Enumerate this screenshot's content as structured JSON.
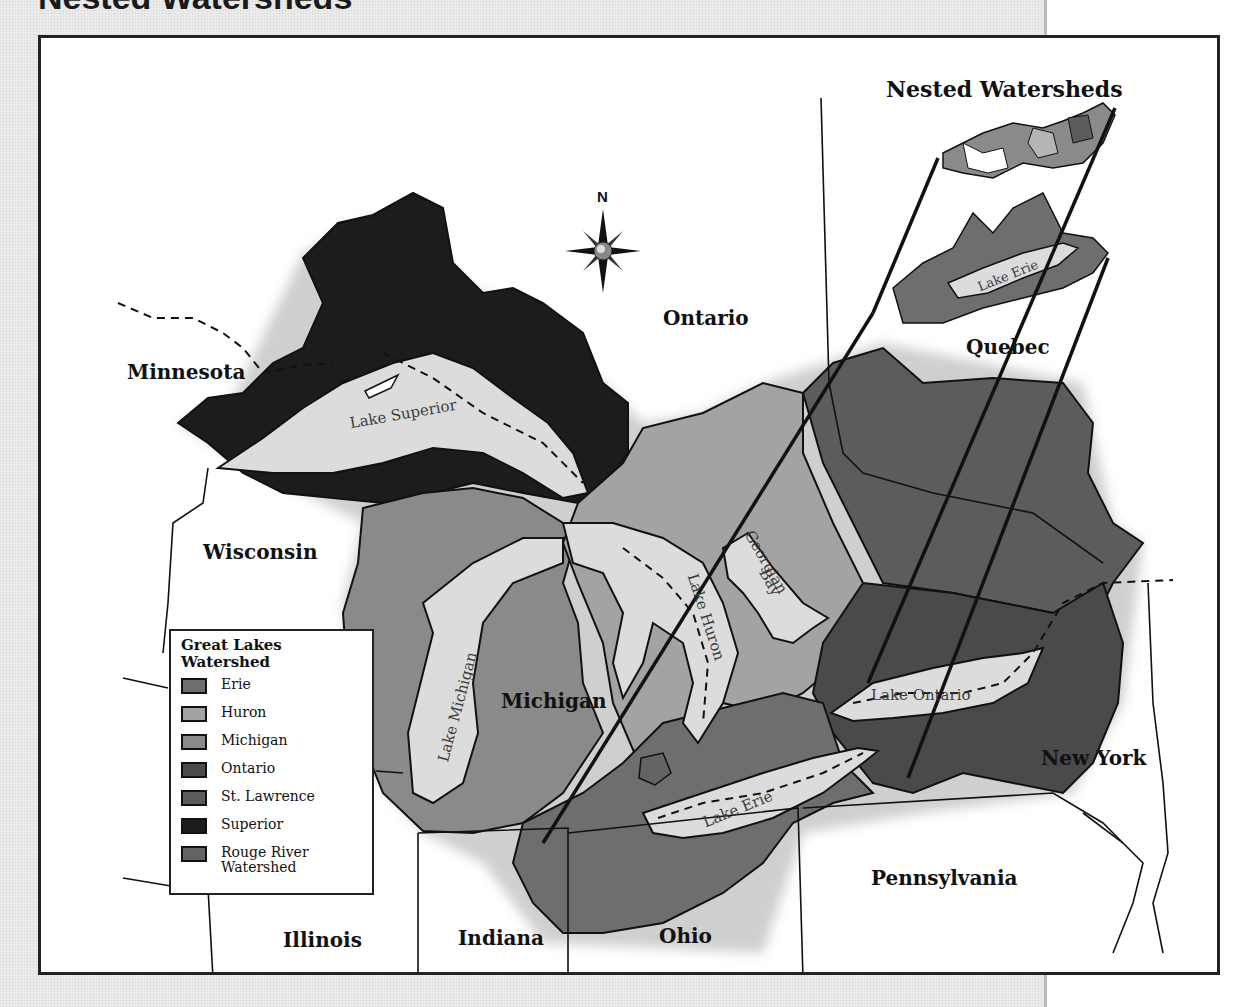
{
  "page": {
    "top_heading": "Nested Watersheds"
  },
  "map": {
    "nested_title": "Nested Watersheds",
    "compass_label": "N",
    "regions": {
      "ontario": "Ontario",
      "quebec": "Quebec",
      "minnesota": "Minnesota",
      "wisconsin": "Wisconsin",
      "michigan": "Michigan",
      "new_york": "New York",
      "pennsylvania": "Pennsylvania",
      "illinois": "Illinois",
      "indiana": "Indiana",
      "ohio": "Ohio"
    },
    "lakes": {
      "superior": "Lake Superior",
      "michigan": "Lake Michigan",
      "huron": "Lake Huron",
      "georgian_bay_1": "Georgian",
      "georgian_bay_2": "Bay",
      "ontario": "Lake Ontario",
      "erie": "Lake Erie",
      "erie_inset": "Lake Erie"
    },
    "colors": {
      "erie": "#6e6e6e",
      "huron": "#a3a3a3",
      "michigan": "#8a8a8a",
      "ontario": "#4a4a4a",
      "st_lawrence": "#5c5c5c",
      "superior": "#1c1c1c",
      "rouge_river": "#646464",
      "lake_water": "#dcdcdc",
      "land": "#ffffff"
    }
  },
  "legend": {
    "title_line1": "Great Lakes",
    "title_line2": "Watershed",
    "items": [
      {
        "label": "Erie",
        "color": "#6e6e6e"
      },
      {
        "label": "Huron",
        "color": "#a3a3a3"
      },
      {
        "label": "Michigan",
        "color": "#8a8a8a"
      },
      {
        "label": "Ontario",
        "color": "#4a4a4a"
      },
      {
        "label": "St. Lawrence",
        "color": "#5c5c5c"
      },
      {
        "label": "Superior",
        "color": "#1c1c1c"
      },
      {
        "label": "Rouge River",
        "label2": "Watershed",
        "color": "#646464"
      }
    ]
  }
}
